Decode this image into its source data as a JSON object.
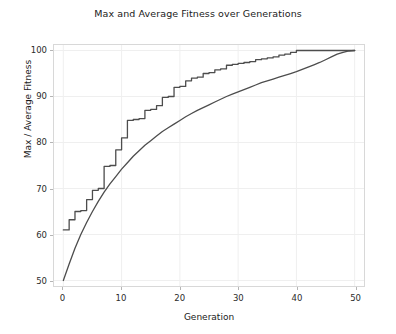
{
  "chart_data": {
    "type": "line",
    "title": "Max and Average Fitness over Generations",
    "xlabel": "Generation",
    "ylabel": "Max / Average Fitness",
    "xlim": [
      -1.6,
      51.6
    ],
    "ylim": [
      48.8,
      101.2
    ],
    "xticks": [
      0,
      10,
      20,
      30,
      40,
      50
    ],
    "yticks": [
      50,
      60,
      70,
      80,
      90,
      100
    ],
    "grid": true,
    "legend": null,
    "legend_position": "none",
    "line_color": "#4d4d4d",
    "grid_color": "#efefef",
    "frame_color": "#d8d8d8",
    "background": "#ffffff",
    "x": [
      0,
      1,
      2,
      3,
      4,
      5,
      6,
      7,
      8,
      9,
      10,
      11,
      12,
      13,
      14,
      15,
      16,
      17,
      18,
      19,
      20,
      21,
      22,
      23,
      24,
      25,
      26,
      27,
      28,
      29,
      30,
      31,
      32,
      33,
      34,
      35,
      36,
      37,
      38,
      39,
      40,
      41,
      42,
      43,
      44,
      45,
      46,
      47,
      48,
      49,
      50
    ],
    "series": [
      {
        "name": "Max Fitness",
        "step": true,
        "values": [
          61.0,
          63.2,
          65.0,
          65.2,
          67.6,
          69.6,
          70.0,
          74.8,
          75.0,
          78.4,
          81.0,
          84.8,
          85.0,
          85.2,
          87.0,
          87.2,
          88.0,
          89.8,
          90.0,
          92.0,
          92.2,
          93.4,
          94.0,
          94.2,
          95.0,
          95.2,
          95.8,
          96.0,
          96.8,
          97.0,
          97.2,
          97.4,
          97.6,
          98.0,
          98.2,
          98.4,
          98.6,
          99.0,
          99.2,
          99.6,
          100.0,
          100.0,
          100.0,
          100.0,
          100.0,
          100.0,
          100.0,
          100.0,
          100.0,
          100.0,
          100.0
        ]
      },
      {
        "name": "Average Fitness",
        "step": false,
        "values": [
          50.0,
          53.6,
          57.0,
          60.0,
          62.6,
          65.0,
          67.2,
          69.2,
          71.0,
          72.6,
          74.2,
          75.6,
          77.0,
          78.2,
          79.4,
          80.4,
          81.4,
          82.4,
          83.2,
          84.0,
          84.8,
          85.6,
          86.3,
          87.0,
          87.6,
          88.2,
          88.8,
          89.4,
          90.0,
          90.5,
          91.0,
          91.5,
          92.0,
          92.5,
          93.0,
          93.4,
          93.8,
          94.2,
          94.6,
          95.0,
          95.4,
          95.9,
          96.4,
          96.9,
          97.4,
          98.0,
          98.6,
          99.2,
          99.6,
          99.9,
          100.0
        ]
      }
    ]
  }
}
